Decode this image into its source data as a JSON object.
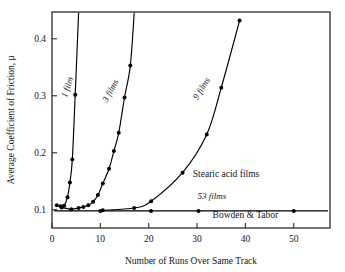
{
  "chart_data": {
    "type": "line",
    "title": "",
    "xlabel": "Number of Runs Over Same Track",
    "ylabel": "Average Coefficient of Friction, μ",
    "xlim": [
      0,
      57.5
    ],
    "ylim": [
      0.068,
      0.447
    ],
    "xticks": [
      0,
      10,
      20,
      30,
      40,
      50
    ],
    "xtick_labels": [
      "0",
      "10",
      "20",
      "30",
      "40",
      "50"
    ],
    "yticks": [
      0.1,
      0.2,
      0.3,
      0.4
    ],
    "ytick_labels": [
      "0.1",
      "0.2",
      "0.3",
      "0.4"
    ],
    "grid": false,
    "legend": "inline-curve-labels",
    "series": [
      {
        "name": "1 film",
        "label": "1 film",
        "label_rotation": -72,
        "points": [
          {
            "x": 1.0,
            "y": 0.108
          },
          {
            "x": 1.8,
            "y": 0.106
          },
          {
            "x": 2.5,
            "y": 0.107
          },
          {
            "x": 3.2,
            "y": 0.122
          },
          {
            "x": 3.7,
            "y": 0.148
          },
          {
            "x": 4.2,
            "y": 0.188
          },
          {
            "x": 4.8,
            "y": 0.302
          },
          {
            "x": 5.5,
            "y": 0.445
          }
        ]
      },
      {
        "name": "3 films",
        "label": "3 films",
        "label_rotation": -62,
        "points": [
          {
            "x": 2.0,
            "y": 0.104
          },
          {
            "x": 4.0,
            "y": 0.101
          },
          {
            "x": 5.5,
            "y": 0.103
          },
          {
            "x": 6.5,
            "y": 0.105
          },
          {
            "x": 7.5,
            "y": 0.108
          },
          {
            "x": 8.5,
            "y": 0.114
          },
          {
            "x": 9.5,
            "y": 0.126
          },
          {
            "x": 10.5,
            "y": 0.146
          },
          {
            "x": 11.8,
            "y": 0.172
          },
          {
            "x": 12.8,
            "y": 0.203
          },
          {
            "x": 13.8,
            "y": 0.235
          },
          {
            "x": 15.0,
            "y": 0.297
          },
          {
            "x": 16.2,
            "y": 0.353
          },
          {
            "x": 17.0,
            "y": 0.445
          }
        ]
      },
      {
        "name": "9 films",
        "label": "9 films",
        "label_rotation": -58,
        "points": [
          {
            "x": 10.5,
            "y": 0.099
          },
          {
            "x": 17.0,
            "y": 0.103
          },
          {
            "x": 20.5,
            "y": 0.115
          },
          {
            "x": 27.0,
            "y": 0.165
          },
          {
            "x": 32.0,
            "y": 0.232
          },
          {
            "x": 35.0,
            "y": 0.314
          },
          {
            "x": 38.8,
            "y": 0.432
          }
        ]
      },
      {
        "name": "53 films",
        "label": "53 films",
        "label_rotation": 0,
        "points": [
          {
            "x": 0.5,
            "y": 0.098
          },
          {
            "x": 10.0,
            "y": 0.098
          },
          {
            "x": 20.5,
            "y": 0.098
          },
          {
            "x": 30.3,
            "y": 0.098
          },
          {
            "x": 50.0,
            "y": 0.098
          },
          {
            "x": 57.0,
            "y": 0.098
          }
        ]
      }
    ],
    "annotations": [
      {
        "text": "Stearic acid films",
        "x": 36.0,
        "y": 0.158
      },
      {
        "text": "Bowden & Tabor",
        "x": 40.0,
        "y": 0.085
      }
    ]
  }
}
